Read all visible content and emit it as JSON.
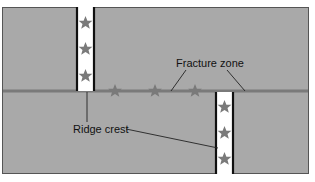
{
  "diagram": {
    "labels": {
      "fracture_zone": "Fracture zone",
      "ridge_crest": "Ridge crest"
    },
    "colors": {
      "plate": "#a9a9a9",
      "ridge_fill": "#ffffff",
      "ridge_border": "#111111",
      "fracture_line": "#7a7a7a",
      "star": "#7a7a7a",
      "leader": "#222222"
    },
    "elements": {
      "left_ridge_segment": {
        "stars": 3
      },
      "right_ridge_segment": {
        "stars": 3
      },
      "transform_fault_stars": 3
    }
  }
}
